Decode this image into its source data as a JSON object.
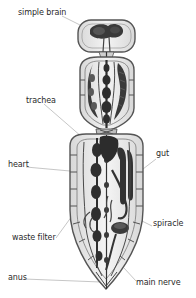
{
  "figure": {
    "colors": {
      "background": "#ffffff",
      "outline": "#555555",
      "organ_dark": "#2f2f2f",
      "organ_mid": "#6a6a6a",
      "body_fill": "#ededed",
      "label_text": "#2a2a2a",
      "leader_line": "#9a9a9a"
    },
    "segments": [
      "head",
      "thorax",
      "abdomen"
    ]
  },
  "labels": {
    "simple_brain": "simple brain",
    "trachea": "trachea",
    "heart": "heart",
    "gut": "gut",
    "spiracle": "spiracle",
    "waste_filter": "waste filter",
    "anus": "anus",
    "main_nerve": "main nerve"
  }
}
